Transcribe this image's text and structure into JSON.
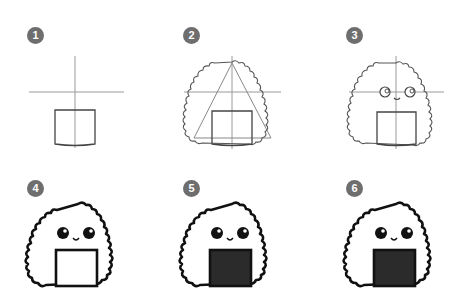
{
  "colors": {
    "background": "#ffffff",
    "badge": "#6e6e6e",
    "badge_text": "#ffffff",
    "guide_line": "#9a9a9a",
    "sketch_line": "#555555",
    "ink_line": "#111111",
    "nori_fill": "#2b2b2b"
  },
  "steps": [
    {
      "number": "1",
      "description": "Guide cross and rectangle"
    },
    {
      "number": "2",
      "description": "Triangle guide and bumpy rice outline"
    },
    {
      "number": "3",
      "description": "Eyes and smile added"
    },
    {
      "number": "4",
      "description": "Inked outline"
    },
    {
      "number": "5",
      "description": "Nori filled in"
    },
    {
      "number": "6",
      "description": "Final onigiri"
    }
  ]
}
